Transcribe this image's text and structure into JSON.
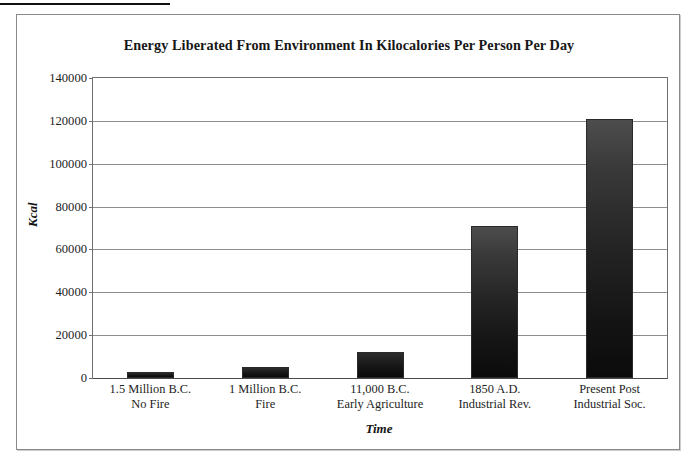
{
  "page": {
    "top_rule": "horizontal-rule"
  },
  "chart_data": {
    "type": "bar",
    "title": "Energy Liberated From Environment In Kilocalories Per Person Per Day",
    "xlabel": "Time",
    "ylabel": "Kcal",
    "ylim": [
      0,
      140000
    ],
    "ytick_step": 20000,
    "yticks": [
      "0",
      "20000",
      "40000",
      "60000",
      "80000",
      "100000",
      "120000",
      "140000"
    ],
    "ytick_values": [
      0,
      20000,
      40000,
      60000,
      80000,
      100000,
      120000,
      140000
    ],
    "grid": true,
    "legend": "none",
    "categories": [
      "1.5 Million B.C.\nNo Fire",
      "1 Million B.C.\nFire",
      "11,000 B.C.\nEarly Agriculture",
      "1850 A.D.\nIndustrial Rev.",
      "Present Post\nIndustrial Soc."
    ],
    "category_lines": [
      [
        "1.5 Million B.C.",
        "No Fire"
      ],
      [
        "1 Million B.C.",
        "Fire"
      ],
      [
        "11,000 B.C.",
        "Early Agriculture"
      ],
      [
        "1850 A.D.",
        "Industrial Rev."
      ],
      [
        "Present Post",
        "Industrial Soc."
      ]
    ],
    "values": [
      3000,
      5000,
      12000,
      71000,
      121000
    ],
    "bar_color": "#141414",
    "plot_border_color": "#6f6f6f",
    "grid_color": "#8d8d8d"
  }
}
